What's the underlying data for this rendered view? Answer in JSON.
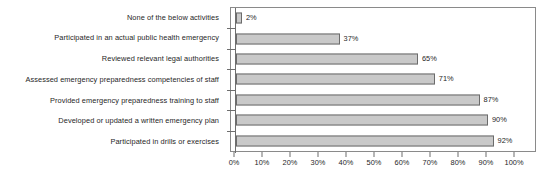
{
  "chart_data": {
    "type": "bar",
    "orientation": "horizontal",
    "title": "",
    "subtitle": "",
    "xlabel": "",
    "ylabel": "",
    "xlim": [
      0,
      100
    ],
    "grid": false,
    "legend": null,
    "legend_position": "none",
    "value_suffix": "%",
    "categories": [
      "None of the below activities",
      "Participated in an actual public health emergency",
      "Reviewed relevant legal authorities",
      "Assessed emergency preparedness competencies of staff",
      "Provided emergency preparedness training to staff",
      "Developed or updated a written emergency plan",
      "Participated in drills or exercises"
    ],
    "values": [
      2,
      37,
      65,
      71,
      87,
      90,
      92
    ],
    "data_labels": [
      "2%",
      "37%",
      "65%",
      "71%",
      "87%",
      "90%",
      "92%"
    ],
    "xticks": [
      0,
      10,
      20,
      30,
      40,
      50,
      60,
      70,
      80,
      90,
      100
    ],
    "xticklabels": [
      "0%",
      "10%",
      "20%",
      "30%",
      "40%",
      "50%",
      "60%",
      "70%",
      "80%",
      "90%",
      "100%"
    ],
    "colors": {
      "bar_fill": "#c9c9c9",
      "bar_border": "#6b6b6b",
      "frame": "#8a8a8a",
      "axis": "#6e6e6e",
      "text": "#262626",
      "background": "#ffffff"
    }
  }
}
